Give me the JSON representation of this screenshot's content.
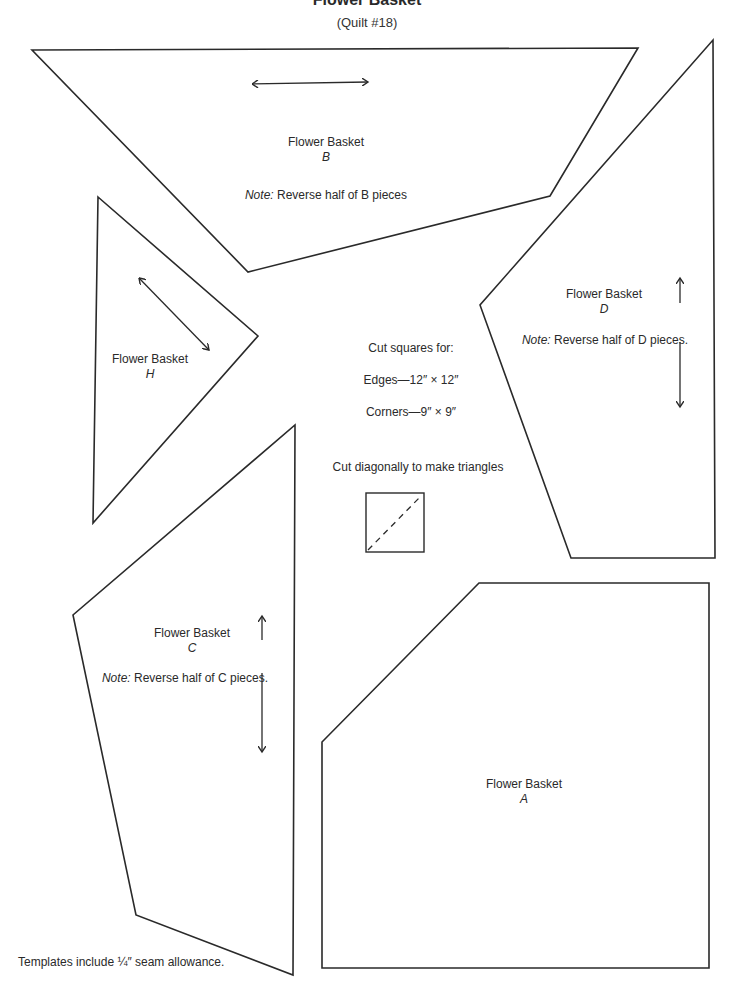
{
  "header": {
    "title": "Flower Basket",
    "subtitle": "(Quilt #18)"
  },
  "pieces": {
    "B": {
      "name": "Flower Basket",
      "letter": "B",
      "note_prefix": "Note:",
      "note_text": " Reverse half of B pieces",
      "grain_arrow": "horizontal"
    },
    "D": {
      "name": "Flower Basket",
      "letter": "D",
      "note_prefix": "Note:",
      "note_text": " Reverse half of D pieces.",
      "grain_arrow": "vertical"
    },
    "H": {
      "name": "Flower Basket",
      "letter": "H",
      "grain_arrow": "diagonal"
    },
    "C": {
      "name": "Flower Basket",
      "letter": "C",
      "note_prefix": "Note:",
      "note_text": " Reverse half of C pieces.",
      "grain_arrow": "vertical"
    },
    "A": {
      "name": "Flower Basket",
      "letter": "A"
    }
  },
  "instructions": {
    "cut_squares_heading": "Cut squares for:",
    "edges": "Edges—12″ × 12″",
    "corners": "Corners—9″ × 9″",
    "diagonal_note": "Cut diagonally to make triangles",
    "diagram_icon": "square-cut-diagonal-icon"
  },
  "footer": {
    "seam_note": "Templates include ¼″ seam allowance."
  },
  "colors": {
    "line": "#2a2a2a",
    "background": "#ffffff"
  }
}
